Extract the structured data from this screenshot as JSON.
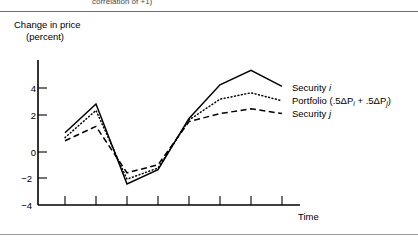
{
  "page": {
    "caption_top": "correlation of +1)",
    "time_axis_label": "Time"
  },
  "axis": {
    "y_title_line1": "Change in price",
    "y_title_line2": "(percent)",
    "y_ticks": [
      "4",
      "2",
      "0",
      "−2",
      "−4"
    ]
  },
  "legend": {
    "security_i": "Security ",
    "security_i_sub": "i",
    "portfolio_prefix": "Portfolio (.5ΔP",
    "portfolio_sub1": "i",
    "portfolio_mid": "  +  .5ΔP",
    "portfolio_sub2": "j",
    "portfolio_suffix": ")",
    "security_j": "Security ",
    "security_j_sub": "j"
  },
  "chart_data": {
    "type": "line",
    "title": "",
    "xlabel": "Time",
    "ylabel": "Change in price (percent)",
    "ylim": [
      -4,
      6
    ],
    "yticks": [
      4,
      2,
      0,
      -2,
      -4
    ],
    "grid": false,
    "legend_position": "right",
    "x": [
      1,
      2,
      3,
      4,
      5,
      6,
      7,
      8
    ],
    "xtick_labels": [
      "",
      "",
      "",
      "",
      "",
      "",
      "",
      ""
    ],
    "series": [
      {
        "name": "Security i",
        "style": "solid",
        "color": "#000000",
        "values": [
          1.2,
          3.0,
          -2.0,
          -1.1,
          2.1,
          4.2,
          5.1,
          4.1
        ]
      },
      {
        "name": "Portfolio (.5ΔPi + .5ΔPj)",
        "style": "dotted",
        "color": "#000000",
        "values": [
          0.9,
          2.6,
          -1.7,
          -1.0,
          2.0,
          3.3,
          3.7,
          3.2
        ]
      },
      {
        "name": "Security j",
        "style": "dashed",
        "color": "#000000",
        "values": [
          0.7,
          1.6,
          -1.3,
          -0.8,
          1.9,
          2.4,
          2.7,
          2.4
        ]
      }
    ]
  },
  "colors": {
    "ink": "#000000",
    "rule": "#6f6f6f",
    "caption": "#4a4a4a"
  }
}
